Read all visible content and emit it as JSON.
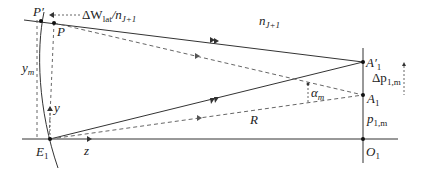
{
  "diagram": {
    "labels": {
      "P_prime": "P′",
      "P": "P",
      "delta_W_lat": "ΔW",
      "delta_W_lat_sub": "lat",
      "over_n": "/n",
      "n_sub_top": "J+1",
      "n_medium": "n",
      "n_medium_sub": "J+1",
      "A1_prime": "A′",
      "A1_prime_sub": "1",
      "delta_p": "Δp",
      "delta_p_sub": "1,m",
      "alpha": "α",
      "alpha_sub": "m",
      "A1": "A",
      "A1_sub": "1",
      "p1m": "p",
      "p1m_sub": "1,m",
      "R": "R",
      "y_m": "y",
      "y_m_sub": "m",
      "y_axis": "y",
      "E1": "E",
      "E1_sub": "1",
      "z_axis": "z",
      "O1": "O",
      "O1_sub": "1"
    },
    "colors": {
      "line": "#333333",
      "dashed": "#666666",
      "text": "#222222"
    }
  }
}
